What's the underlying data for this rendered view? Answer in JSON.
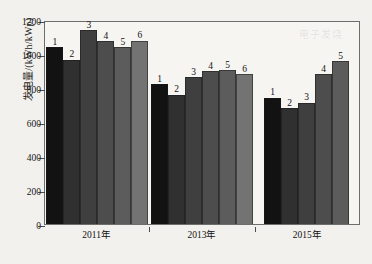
{
  "chart_data": {
    "type": "bar",
    "title": "",
    "xlabel": "",
    "ylabel": "发电量/(kWh/kWp)",
    "ylim": [
      0,
      1200
    ],
    "yticks": [
      0,
      200,
      400,
      600,
      800,
      1000,
      1200
    ],
    "grid": false,
    "legend": "none",
    "categories": [
      "2011年",
      "2013年",
      "2015年"
    ],
    "point_labels": [
      "1",
      "2",
      "3",
      "4",
      "5",
      "6"
    ],
    "groups": [
      {
        "category": "2011年",
        "bars": [
          {
            "label": "1",
            "value": 1040,
            "color": "#121212"
          },
          {
            "label": "2",
            "value": 965,
            "color": "#303030"
          },
          {
            "label": "3",
            "value": 1140,
            "color": "#3f3f3f"
          },
          {
            "label": "4",
            "value": 1075,
            "color": "#4d4d4d"
          },
          {
            "label": "5",
            "value": 1040,
            "color": "#5c5c5c"
          },
          {
            "label": "6",
            "value": 1078,
            "color": "#737373"
          }
        ]
      },
      {
        "category": "2013年",
        "bars": [
          {
            "label": "1",
            "value": 822,
            "color": "#121212"
          },
          {
            "label": "2",
            "value": 760,
            "color": "#303030"
          },
          {
            "label": "3",
            "value": 862,
            "color": "#3f3f3f"
          },
          {
            "label": "4",
            "value": 900,
            "color": "#4d4d4d"
          },
          {
            "label": "5",
            "value": 905,
            "color": "#5c5c5c"
          },
          {
            "label": "6",
            "value": 880,
            "color": "#737373"
          }
        ]
      },
      {
        "category": "2015年",
        "bars": [
          {
            "label": "1",
            "value": 742,
            "color": "#121212"
          },
          {
            "label": "2",
            "value": 682,
            "color": "#303030"
          },
          {
            "label": "3",
            "value": 712,
            "color": "#3f3f3f"
          },
          {
            "label": "4",
            "value": 880,
            "color": "#4d4d4d"
          },
          {
            "label": "5",
            "value": 958,
            "color": "#5c5c5c"
          }
        ]
      }
    ]
  },
  "watermark": {
    "text": "电子发烧"
  },
  "axis": {
    "y_title": "发电量/(kWh/kWp)"
  }
}
